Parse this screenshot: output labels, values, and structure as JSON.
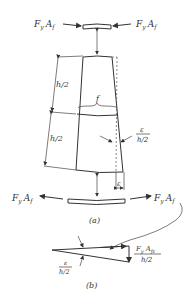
{
  "figure": {
    "part_a": {
      "caption": "(a)",
      "top_force_left": "F",
      "top_force_left_sub1": "y",
      "top_force_left_A": "A",
      "top_force_left_sub2": "f",
      "top_force_right": "F",
      "top_force_right_sub1": "y",
      "top_force_right_A": "A",
      "top_force_right_sub2": "f",
      "bottom_force_left": "F",
      "bottom_force_left_sub1": "y",
      "bottom_force_left_A": "A",
      "bottom_force_left_sub2": "f",
      "bottom_force_right": "F",
      "bottom_force_right_sub1": "y",
      "bottom_force_right_A": "A",
      "bottom_force_right_sub2": "f",
      "upper_half_label": "h/2",
      "lower_half_label": "h/2",
      "brace_label": "f",
      "angle_numerator": "ε",
      "angle_denominator": "h/2",
      "offset_label": "ε"
    },
    "part_b": {
      "caption": "(b)",
      "angle_numerator": "ε",
      "angle_denominator": "h/2",
      "force_numerator": "F",
      "force_numerator_sub": "y",
      "force_numerator_rest": "A",
      "force_numerator_sub2": "fε",
      "force_denominator": "h/2"
    }
  }
}
